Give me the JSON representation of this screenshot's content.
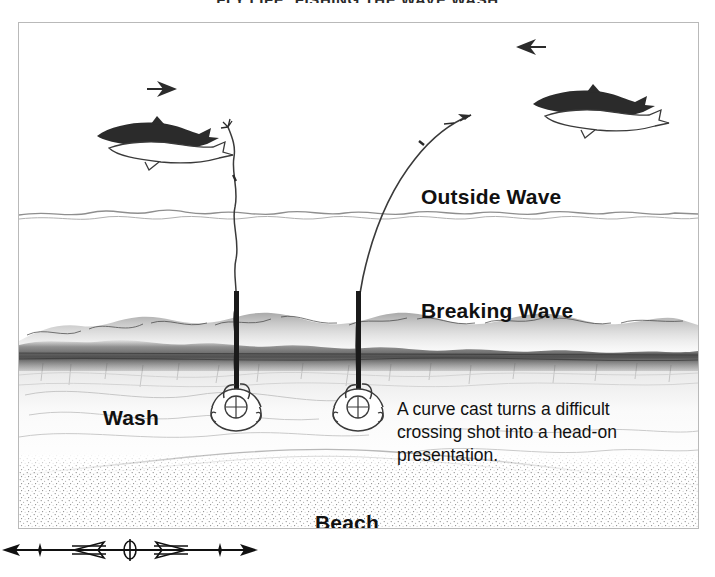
{
  "page": {
    "title": "FLY LIFE: FISHING THE WAVE WASH",
    "background_color": "#ffffff",
    "ink_color": "#111111"
  },
  "figure": {
    "frame": {
      "border_color": "#b9b9b9"
    },
    "zone_labels": [
      {
        "id": "outside-wave",
        "text": "Outside Wave"
      },
      {
        "id": "breaking-wave",
        "text": "Breaking Wave"
      },
      {
        "id": "wash",
        "text": "Wash"
      },
      {
        "id": "beach",
        "text": "Beach"
      }
    ],
    "caption": {
      "line1": "A curve cast turns a difficult",
      "line2": "crossing shot into a head-on",
      "line3": "presentation."
    },
    "annotations": {
      "arrow_left_fish_direction": "arrow-right-icon",
      "arrow_right_fish_direction": "arrow-left-icon",
      "angler_left": "angler-overhead-icon",
      "angler_right": "angler-overhead-icon",
      "line_left": "straight-cast-line",
      "line_right": "curve-cast-line",
      "fish_pair_left": "fish-pair-icon",
      "fish_pair_right": "fish-pair-icon"
    },
    "ornament": "double-arrow-divider-ornament"
  }
}
